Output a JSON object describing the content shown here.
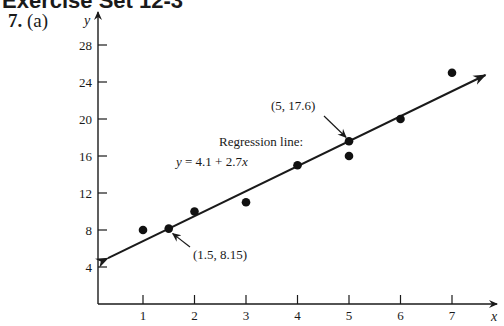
{
  "header": {
    "section_title": "Exercise Set 12-3"
  },
  "problem": {
    "number": "7.",
    "part": "(a)"
  },
  "chart_data": {
    "type": "scatter",
    "title": "",
    "xlabel": "x",
    "ylabel": "y",
    "x_ticks": [
      1,
      2,
      3,
      4,
      5,
      6,
      7
    ],
    "y_ticks": [
      4,
      8,
      12,
      16,
      20,
      24,
      28
    ],
    "xlim": [
      0,
      7.8
    ],
    "ylim": [
      0,
      30
    ],
    "grid": false,
    "legend": null,
    "points": [
      {
        "x": 1,
        "y": 8
      },
      {
        "x": 2,
        "y": 10
      },
      {
        "x": 3,
        "y": 11
      },
      {
        "x": 4,
        "y": 15
      },
      {
        "x": 5,
        "y": 16
      },
      {
        "x": 6,
        "y": 20
      },
      {
        "x": 7,
        "y": 25
      }
    ],
    "regression_line": {
      "label": "Regression line:",
      "equation": "y = 4.1 + 2.7x",
      "intercept": 4.1,
      "slope": 2.7,
      "marked_points": [
        {
          "x": 1.5,
          "y": 8.15,
          "label": "(1.5, 8.15)"
        },
        {
          "x": 5,
          "y": 17.6,
          "label": "(5, 17.6)"
        }
      ]
    }
  }
}
